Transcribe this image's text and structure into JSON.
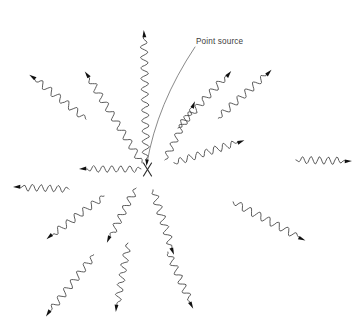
{
  "canvas": {
    "width": 361,
    "height": 319,
    "background": "#ffffff",
    "title": "Point source radiation diagram"
  },
  "colors": {
    "background": "#ffffff",
    "wave_stroke": "#4a4a4a",
    "arrow_fill": "#111111",
    "source_mark": "#2b2b2b",
    "leader_line": "#6b6b6b",
    "label_text": "#3c3c3c"
  },
  "labels": [
    {
      "id": "point-source-label",
      "text": "Point source",
      "x": 196,
      "y": 44,
      "font_size": 8.2
    }
  ],
  "source_marker": {
    "id": "point-source-marker",
    "glyph": "x-cross",
    "x": 147.5,
    "y": 169.5,
    "arm": 6.5
  },
  "leader": {
    "id": "point-source-leader",
    "from_x": 195,
    "from_y": 47,
    "ctrl_x": 157,
    "ctrl_y": 104,
    "to_x": 147,
    "to_y": 163,
    "arrow_angle_deg": 100
  },
  "rays": [
    {
      "id": "ray-up",
      "name": "ray-up",
      "x0": 146,
      "y0": 160,
      "angle_deg": -91,
      "length": 130,
      "amplitude": 3.6,
      "wavelength": 10.5,
      "attached": true
    },
    {
      "id": "ray-up-left-steep",
      "name": "ray-up-left-steep",
      "x0": 142,
      "y0": 163,
      "angle_deg": -122,
      "length": 108,
      "amplitude": 3.4,
      "wavelength": 11.0,
      "attached": true
    },
    {
      "id": "ray-up-left-shallow",
      "name": "ray-up-left-shallow",
      "x0": 86,
      "y0": 119,
      "angle_deg": -142,
      "length": 72,
      "amplitude": 3.4,
      "wavelength": 11.0,
      "attached": false
    },
    {
      "id": "ray-left",
      "name": "ray-left",
      "x0": 141,
      "y0": 169,
      "angle_deg": 180,
      "length": 62,
      "amplitude": 3.2,
      "wavelength": 9.0,
      "attached": true
    },
    {
      "id": "ray-left-detached",
      "name": "ray-left-detached",
      "x0": 69,
      "y0": 189,
      "angle_deg": 182,
      "length": 56,
      "amplitude": 3.4,
      "wavelength": 8.6,
      "attached": false
    },
    {
      "id": "ray-down-left-steep",
      "name": "ray-down-left-steep",
      "x0": 104,
      "y0": 196,
      "angle_deg": 143,
      "length": 72,
      "amplitude": 3.4,
      "wavelength": 10.5,
      "attached": false
    },
    {
      "id": "ray-down-left-far",
      "name": "ray-down-left-far",
      "x0": 94,
      "y0": 255,
      "angle_deg": 128,
      "length": 78,
      "amplitude": 3.4,
      "wavelength": 10.5,
      "attached": false
    },
    {
      "id": "ray-down-center-left",
      "name": "ray-down-center-left",
      "x0": 136,
      "y0": 188,
      "angle_deg": 118,
      "length": 62,
      "amplitude": 3.4,
      "wavelength": 10.0,
      "attached": true
    },
    {
      "id": "ray-down-center-left-far",
      "name": "ray-down-center-left-far",
      "x0": 128,
      "y0": 243,
      "angle_deg": 100,
      "length": 70,
      "amplitude": 3.4,
      "wavelength": 10.0,
      "attached": false
    },
    {
      "id": "ray-down",
      "name": "ray-down",
      "x0": 153,
      "y0": 190,
      "angle_deg": 72,
      "length": 68,
      "amplitude": 3.6,
      "wavelength": 10.5,
      "attached": true
    },
    {
      "id": "ray-down-right-far",
      "name": "ray-down-right-far",
      "x0": 168,
      "y0": 252,
      "angle_deg": 66,
      "length": 62,
      "amplitude": 3.4,
      "wavelength": 10.0,
      "attached": false
    },
    {
      "id": "ray-right-down",
      "name": "ray-right-down",
      "x0": 233,
      "y0": 202,
      "angle_deg": 28,
      "length": 82,
      "amplitude": 3.6,
      "wavelength": 10.5,
      "attached": false
    },
    {
      "id": "ray-right",
      "name": "ray-right",
      "x0": 296,
      "y0": 160,
      "angle_deg": 1,
      "length": 56,
      "amplitude": 3.6,
      "wavelength": 8.6,
      "attached": false
    },
    {
      "id": "ray-right-up-shallow",
      "name": "ray-right-up-shallow",
      "x0": 174,
      "y0": 163,
      "angle_deg": -18,
      "length": 74,
      "amplitude": 3.4,
      "wavelength": 9.2,
      "attached": false
    },
    {
      "id": "ray-up-right-mid",
      "name": "ray-up-right-mid",
      "x0": 178,
      "y0": 128,
      "angle_deg": -47,
      "length": 78,
      "amplitude": 3.4,
      "wavelength": 10.5,
      "attached": false
    },
    {
      "id": "ray-up-right-outer",
      "name": "ray-up-right-outer",
      "x0": 218,
      "y0": 118,
      "angle_deg": -42,
      "length": 72,
      "amplitude": 3.4,
      "wavelength": 10.5,
      "attached": false
    },
    {
      "id": "ray-up-right-steep",
      "name": "ray-up-right-steep",
      "x0": 165,
      "y0": 160,
      "angle_deg": -63,
      "length": 66,
      "amplitude": 3.2,
      "wavelength": 10.0,
      "attached": true
    }
  ]
}
